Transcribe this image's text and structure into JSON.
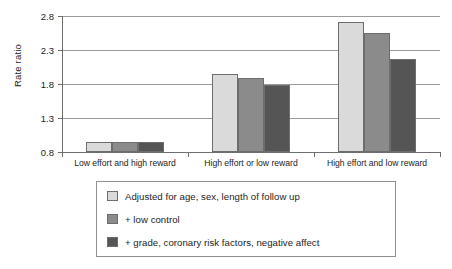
{
  "chart_data": {
    "type": "bar",
    "title": "",
    "subtitle": "",
    "xlabel": "",
    "ylabel": "Rate ratio",
    "ylim": [
      0.8,
      2.8
    ],
    "yticks": [
      "0.8",
      "1.3",
      "1.8",
      "2.3",
      "2.8"
    ],
    "ytick_values": [
      0.8,
      1.3,
      1.8,
      2.3,
      2.8
    ],
    "grid": true,
    "legend_position": "bottom",
    "categories": [
      "Low effort and high reward",
      "High effort or low reward",
      "High effort and low reward"
    ],
    "series": [
      {
        "name": "Adjusted for age, sex, length of follow up",
        "color": "#dadada",
        "values": [
          0.95,
          1.95,
          2.71
        ]
      },
      {
        "name": "+ low control",
        "color": "#8b8b8b",
        "values": [
          0.95,
          1.89,
          2.55
        ]
      },
      {
        "name": "+ grade, coronary risk factors, negative affect",
        "color": "#555555",
        "values": [
          0.95,
          1.78,
          2.17
        ]
      }
    ]
  },
  "axis": {
    "y_title": "Rate ratio",
    "ticks": [
      {
        "label": "2.8"
      },
      {
        "label": "2.3"
      },
      {
        "label": "1.8"
      },
      {
        "label": "1.3"
      },
      {
        "label": "0.8"
      }
    ]
  },
  "categories": [
    {
      "label": "Low effort and high reward"
    },
    {
      "label": "High effort or low reward"
    },
    {
      "label": "High effort and low reward"
    }
  ],
  "legend": {
    "items": [
      {
        "label": "Adjusted for age, sex, length of follow up",
        "color": "#dadada"
      },
      {
        "label": "+ low control",
        "color": "#8b8b8b"
      },
      {
        "label": "+ grade, coronary risk factors, negative affect",
        "color": "#555555"
      }
    ]
  },
  "colors": {
    "series1": "#dadada",
    "series2": "#8b8b8b",
    "series3": "#555555",
    "axis": "#6e6e6e",
    "grid": "#9a9a9a",
    "background": "#ffffff"
  }
}
